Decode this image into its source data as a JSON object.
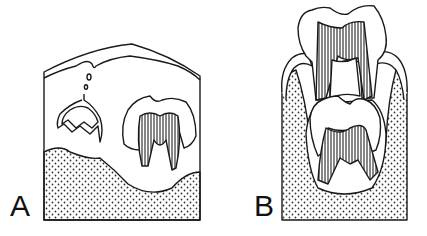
{
  "figure": {
    "panels": [
      {
        "id": "A",
        "label": "A",
        "description": "Developing tooth crown within jaw bone beneath gum; successional tooth germ connected by dental lamina"
      },
      {
        "id": "B",
        "label": "B",
        "description": "Erupting primary tooth above developing permanent tooth within bony crypt"
      }
    ]
  },
  "colors": {
    "line": "#1a1a1a",
    "background": "#ffffff",
    "stipple": "#333333"
  }
}
